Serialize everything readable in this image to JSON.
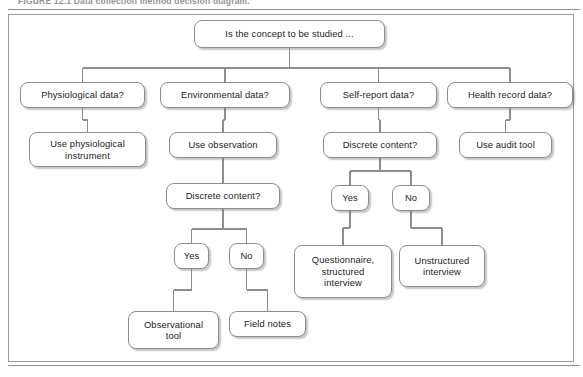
{
  "figure": {
    "caption": "FIGURE 12.1  Data collection method decision diagram."
  },
  "diagram": {
    "root": {
      "id": "root",
      "label": "Is the concept to be studied ...",
      "x": 194,
      "y": 20,
      "w": 191,
      "h": 28
    },
    "nodes": [
      {
        "id": "physiological-data",
        "label": "Physiological data?",
        "x": 20,
        "y": 82,
        "w": 125,
        "h": 26
      },
      {
        "id": "environmental-data",
        "label": "Environmental data?",
        "x": 160,
        "y": 82,
        "w": 130,
        "h": 26
      },
      {
        "id": "self-report-data",
        "label": "Self-report data?",
        "x": 320,
        "y": 82,
        "w": 117,
        "h": 26
      },
      {
        "id": "health-record-data",
        "label": "Health record data?",
        "x": 447,
        "y": 82,
        "w": 126,
        "h": 26
      },
      {
        "id": "use-physiological-instrument",
        "label": "Use physiological\ninstrument",
        "x": 29,
        "y": 132,
        "w": 117,
        "h": 35
      },
      {
        "id": "use-observation",
        "label": "Use observation",
        "x": 169,
        "y": 132,
        "w": 108,
        "h": 26
      },
      {
        "id": "discrete-content-self-report",
        "label": "Discrete content?",
        "x": 323,
        "y": 132,
        "w": 114,
        "h": 26
      },
      {
        "id": "use-audit-tool",
        "label": "Use audit tool",
        "x": 459,
        "y": 132,
        "w": 93,
        "h": 26
      },
      {
        "id": "discrete-content-observation",
        "label": "Discrete content?",
        "x": 166,
        "y": 183,
        "w": 114,
        "h": 26
      },
      {
        "id": "self-report-yes",
        "label": "Yes",
        "x": 331,
        "y": 185,
        "w": 38,
        "h": 26
      },
      {
        "id": "self-report-no",
        "label": "No",
        "x": 392,
        "y": 185,
        "w": 38,
        "h": 26
      },
      {
        "id": "questionnaire-structured-interview",
        "label": "Questionnaire,\nstructured\ninterview",
        "x": 294,
        "y": 245,
        "w": 98,
        "h": 53
      },
      {
        "id": "unstructured-interview",
        "label": "Unstructured\ninterview",
        "x": 399,
        "y": 245,
        "w": 86,
        "h": 42
      },
      {
        "id": "observation-yes",
        "label": "Yes",
        "x": 174,
        "y": 243,
        "w": 35,
        "h": 26
      },
      {
        "id": "observation-no",
        "label": "No",
        "x": 229,
        "y": 243,
        "w": 35,
        "h": 26
      },
      {
        "id": "observational-tool",
        "label": "Observational\ntool",
        "x": 128,
        "y": 311,
        "w": 91,
        "h": 38
      },
      {
        "id": "field-notes",
        "label": "Field notes",
        "x": 229,
        "y": 311,
        "w": 77,
        "h": 26
      }
    ],
    "edges": [
      {
        "from": "root",
        "to": "physiological-data"
      },
      {
        "from": "root",
        "to": "environmental-data"
      },
      {
        "from": "root",
        "to": "self-report-data"
      },
      {
        "from": "root",
        "to": "health-record-data"
      },
      {
        "from": "physiological-data",
        "to": "use-physiological-instrument"
      },
      {
        "from": "environmental-data",
        "to": "use-observation"
      },
      {
        "from": "self-report-data",
        "to": "discrete-content-self-report"
      },
      {
        "from": "health-record-data",
        "to": "use-audit-tool"
      },
      {
        "from": "use-observation",
        "to": "discrete-content-observation"
      },
      {
        "from": "discrete-content-self-report",
        "to": "self-report-yes"
      },
      {
        "from": "discrete-content-self-report",
        "to": "self-report-no"
      },
      {
        "from": "self-report-yes",
        "to": "questionnaire-structured-interview"
      },
      {
        "from": "self-report-no",
        "to": "unstructured-interview"
      },
      {
        "from": "discrete-content-observation",
        "to": "observation-yes"
      },
      {
        "from": "discrete-content-observation",
        "to": "observation-no"
      },
      {
        "from": "observation-yes",
        "to": "observational-tool"
      },
      {
        "from": "observation-no",
        "to": "field-notes"
      }
    ],
    "style": {
      "line_color": "#8d8d8d",
      "node_border": "#8d8d8d",
      "node_fill": "#ffffff",
      "text_color": "#1c1c1c",
      "frame_border": "#9a9a9a",
      "page_background": "#ffffff"
    }
  }
}
